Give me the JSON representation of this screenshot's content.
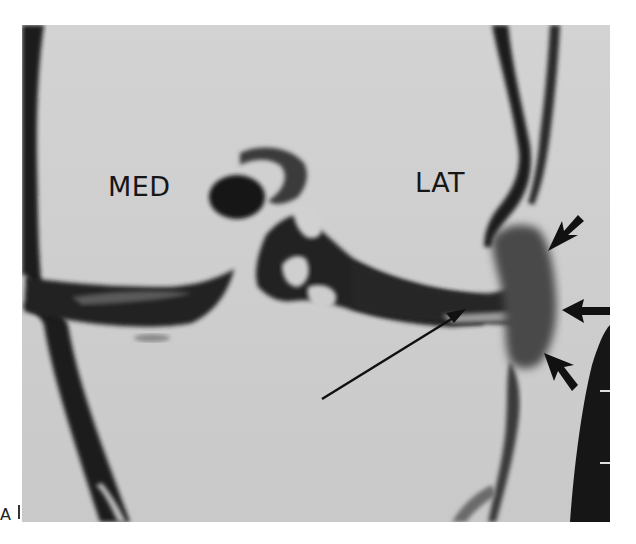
{
  "figure": {
    "type": "knee arthrogram (coronal)",
    "labels": {
      "medial": "MED",
      "lateral": "LAT",
      "panel": "A"
    },
    "annotations": [
      {
        "type": "long-arrow",
        "direction": "up-right",
        "target": "lateral meniscus"
      },
      {
        "type": "short-arrow",
        "direction": "down-left",
        "position": "upper-right"
      },
      {
        "type": "short-arrow",
        "direction": "left",
        "position": "middle-right"
      },
      {
        "type": "short-arrow",
        "direction": "up-left",
        "position": "lower-right"
      }
    ],
    "colors": {
      "background": "#cfcfcf",
      "contrast": "#1a1a1a",
      "page": "#ffffff"
    }
  }
}
